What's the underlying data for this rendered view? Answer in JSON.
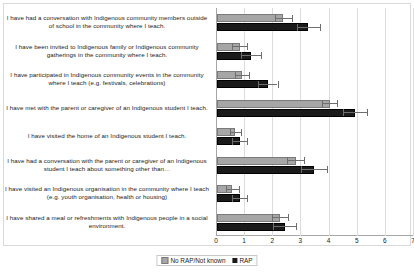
{
  "chart_data": {
    "type": "bar",
    "orientation": "horizontal",
    "title": "",
    "xlabel": "",
    "ylabel": "",
    "xlim": [
      0,
      7
    ],
    "xticks": [
      0,
      1,
      2,
      3,
      4,
      5,
      6,
      7
    ],
    "grid": true,
    "legend_position": "bottom-center",
    "categories": [
      "I have had a conversation with Indigenous community members outside of school in the community where I teach.",
      "I have been invited to Indigenous family or Indigenous community gatherings in the community where I teach.",
      "I have participated in Indigenous community events in the community where I teach (e.g. festivals, celebrations)",
      "I have met with the parent or caregiver of an Indigenous student I teach.",
      "I have visited the home of an Indigenous student I teach.",
      "I have had a conversation with the parent or caregiver of an Indigenous student I teach about something other than…",
      "I have visited an Indigenous organisation in the community where I teach (e.g. youth organisation, health or housing)",
      "I have shared a meal or refreshments with Indigenous people in a social environment."
    ],
    "series": [
      {
        "name": "No RAP/Not known",
        "color": "#a6a6a6",
        "values": [
          2.35,
          0.8,
          0.9,
          4.0,
          0.65,
          2.8,
          0.55,
          2.25
        ],
        "errors": [
          0.3,
          0.25,
          0.25,
          0.28,
          0.2,
          0.3,
          0.22,
          0.28
        ]
      },
      {
        "name": "RAP",
        "color": "#1a1a1a",
        "values": [
          3.25,
          1.2,
          1.8,
          4.9,
          0.8,
          3.45,
          0.8,
          2.4
        ],
        "errors": [
          0.4,
          0.35,
          0.35,
          0.42,
          0.25,
          0.45,
          0.28,
          0.4
        ]
      }
    ]
  },
  "legend": {
    "items": [
      {
        "label": "No RAP/Not known"
      },
      {
        "label": "RAP"
      }
    ]
  }
}
